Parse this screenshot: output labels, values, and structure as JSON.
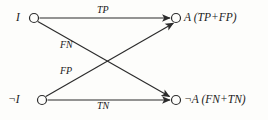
{
  "diagram": {
    "type": "bipartite-graph",
    "background_color": "#fdfdfb",
    "stroke_color": "#2b2b2b",
    "text_color": "#1a1a1a",
    "nodes": [
      {
        "id": "node-i",
        "label": "I",
        "side": "left",
        "position": "top",
        "cx": 34,
        "cy": 18,
        "r": 4.5
      },
      {
        "id": "node-not-i",
        "label": "¬I",
        "side": "left",
        "position": "bottom",
        "cx": 42,
        "cy": 100,
        "r": 4.5
      },
      {
        "id": "node-a",
        "label": "A (TP+FP)",
        "side": "right",
        "position": "top",
        "cx": 176,
        "cy": 18,
        "r": 4.5
      },
      {
        "id": "node-not-a",
        "label": "¬A (FN+TN)",
        "side": "right",
        "position": "bottom",
        "cx": 176,
        "cy": 100,
        "r": 4.5
      }
    ],
    "edges": [
      {
        "id": "edge-tp",
        "label": "TP",
        "from": "node-i",
        "to": "node-a",
        "kind": "horizontal-top"
      },
      {
        "id": "edge-fn",
        "label": "FN",
        "from": "node-i",
        "to": "node-not-a",
        "kind": "diagonal-down"
      },
      {
        "id": "edge-fp",
        "label": "FP",
        "from": "node-not-i",
        "to": "node-a",
        "kind": "diagonal-up"
      },
      {
        "id": "edge-tn",
        "label": "TN",
        "from": "node-not-i",
        "to": "node-not-a",
        "kind": "horizontal-bottom"
      }
    ]
  }
}
